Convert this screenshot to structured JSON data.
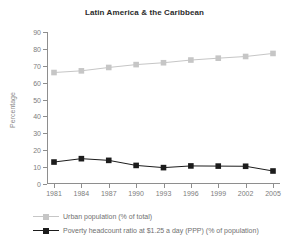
{
  "chart_data": {
    "type": "line",
    "title": "Latin America & the Caribbean",
    "xlabel": "",
    "ylabel": "Percentage",
    "x": [
      1981,
      1984,
      1987,
      1990,
      1993,
      1996,
      1999,
      2002,
      2005
    ],
    "xtick_labels": [
      "1981",
      "1984",
      "1987",
      "1990",
      "1993",
      "1996",
      "1999",
      "2002",
      "2005"
    ],
    "ytick_labels": [
      "0",
      "10",
      "20",
      "30",
      "40",
      "50",
      "60",
      "70",
      "80",
      "90"
    ],
    "yticks": [
      0,
      10,
      20,
      30,
      40,
      50,
      60,
      70,
      80,
      90
    ],
    "ylim": [
      0,
      90
    ],
    "xlim": [
      1981,
      2005
    ],
    "grid": false,
    "legend_position": "bottom-left",
    "series": [
      {
        "name": "Urban population (% of total)",
        "color": "#c6c6c6",
        "marker": "square",
        "values": [
          66.0,
          67.0,
          69.0,
          70.7,
          71.8,
          73.4,
          74.5,
          75.5,
          77.3
        ]
      },
      {
        "name": "Poverty headcount ratio at $1.25 a day (PPP) (% of population)",
        "color": "#1c1c1c",
        "marker": "square",
        "values": [
          13.0,
          15.0,
          14.0,
          11.0,
          9.7,
          10.7,
          10.6,
          10.5,
          7.7
        ]
      }
    ]
  },
  "legend": {
    "items": [
      {
        "label": "Urban population (% of total)",
        "color": "#c6c6c6"
      },
      {
        "label": "Poverty headcount ratio at $1.25 a day (PPP) (% of population)",
        "color": "#1c1c1c"
      }
    ]
  },
  "colors": {
    "axis": "#8e8e8e",
    "tick_text": "#7d7d7d",
    "title_text": "#2b2b2b",
    "legend_text": "#6f6f6f",
    "background": "#ffffff"
  }
}
